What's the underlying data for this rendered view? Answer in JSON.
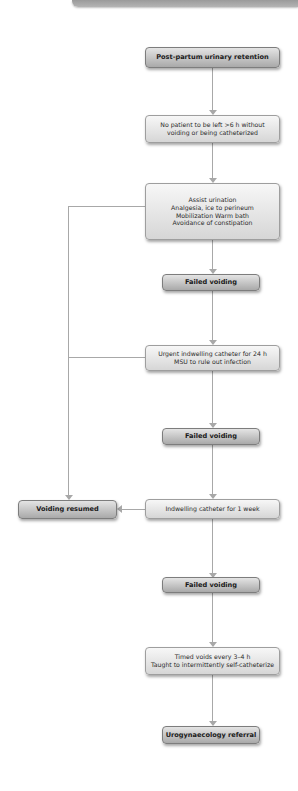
{
  "diagram": {
    "type": "flowchart",
    "colors": {
      "connector": "#a8a8a8",
      "plain_box_fill": "#e8e8e8",
      "strong_box_fill": "#c4c4c4",
      "text": "#2a2a2a"
    },
    "nodes": {
      "start": {
        "lines": [
          "Post-partum urinary retention"
        ]
      },
      "no_patient": {
        "lines": [
          "No patient to be left >6 h without",
          "voiding or being catheterized"
        ]
      },
      "assist": {
        "lines": [
          "Assist urination",
          "Analgesia, ice to perineum",
          "Mobilization Warm bath",
          "Avoidance of constipation"
        ]
      },
      "failed_1": {
        "lines": [
          "Failed voiding"
        ]
      },
      "urgent_catheter": {
        "lines": [
          "Urgent indwelling catheter for 24 h",
          "MSU to rule out infection"
        ]
      },
      "failed_2": {
        "lines": [
          "Failed voiding"
        ]
      },
      "voiding_resumed": {
        "lines": [
          "Voiding resumed"
        ]
      },
      "catheter_week": {
        "lines": [
          "Indwelling catheter for 1 week"
        ]
      },
      "failed_3": {
        "lines": [
          "Failed voiding"
        ]
      },
      "timed_voids": {
        "lines": [
          "Timed voids every 3–4 h",
          "Taught to intermittently self-catheterize"
        ]
      },
      "referral": {
        "lines": [
          "Urogynaecology referral"
        ]
      }
    },
    "edges": [
      [
        "start",
        "no_patient"
      ],
      [
        "no_patient",
        "assist"
      ],
      [
        "assist",
        "failed_1"
      ],
      [
        "assist",
        "voiding_resumed"
      ],
      [
        "failed_1",
        "urgent_catheter"
      ],
      [
        "urgent_catheter",
        "failed_2"
      ],
      [
        "urgent_catheter",
        "voiding_resumed"
      ],
      [
        "failed_2",
        "catheter_week"
      ],
      [
        "catheter_week",
        "voiding_resumed"
      ],
      [
        "catheter_week",
        "failed_3"
      ],
      [
        "failed_3",
        "timed_voids"
      ],
      [
        "timed_voids",
        "referral"
      ]
    ]
  }
}
